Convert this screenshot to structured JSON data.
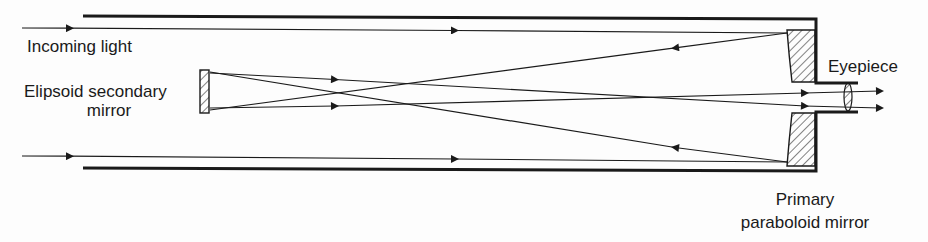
{
  "diagram": {
    "type": "optical-schematic",
    "labels": {
      "incoming_light": "Incoming light",
      "secondary_line1": "Elipsoid secondary",
      "secondary_line2": "mirror",
      "eyepiece": "Eyepiece",
      "primary_line1": "Primary",
      "primary_line2": "paraboloid mirror"
    },
    "components": [
      "tube",
      "primary paraboloid mirror",
      "elipsoid secondary mirror",
      "eyepiece lens"
    ],
    "colors": {
      "ink": "#1a1a1a",
      "background": "#fdfdfd"
    }
  }
}
